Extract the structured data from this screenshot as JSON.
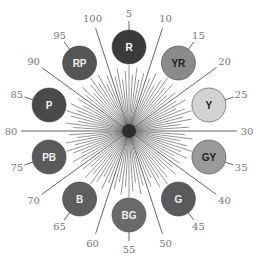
{
  "diagram": {
    "center": [
      129,
      131
    ],
    "start_hue": 5,
    "degrees_per_unit": 3.6,
    "hues": [
      {
        "code": "R",
        "value": 5,
        "fill": "#3a3a3a",
        "text": "#ffffff"
      },
      {
        "code": "YR",
        "value": 15,
        "fill": "#8a8a8a",
        "text": "#1e1e1e"
      },
      {
        "code": "Y",
        "value": 25,
        "fill": "#d2d2d2",
        "text": "#1e1e1e"
      },
      {
        "code": "GY",
        "value": 35,
        "fill": "#9a9a9a",
        "text": "#1e1e1e"
      },
      {
        "code": "G",
        "value": 45,
        "fill": "#5a5a5a",
        "text": "#f0f0f0"
      },
      {
        "code": "BG",
        "value": 55,
        "fill": "#6a6a6a",
        "text": "#f0f0f0"
      },
      {
        "code": "B",
        "value": 65,
        "fill": "#5e5e5e",
        "text": "#f0f0f0"
      },
      {
        "code": "PB",
        "value": 75,
        "fill": "#5a5a5a",
        "text": "#f0f0f0"
      },
      {
        "code": "P",
        "value": 85,
        "fill": "#4a4a4a",
        "text": "#f0f0f0"
      },
      {
        "code": "RP",
        "value": 95,
        "fill": "#555555",
        "text": "#f0f0f0"
      }
    ],
    "tick_labels": [
      "10",
      "20",
      "30",
      "40",
      "50",
      "60",
      "70",
      "80",
      "90",
      "100"
    ],
    "hue_labels": [
      "5",
      "15",
      "25",
      "35",
      "45",
      "55",
      "65",
      "75",
      "85",
      "95"
    ]
  }
}
